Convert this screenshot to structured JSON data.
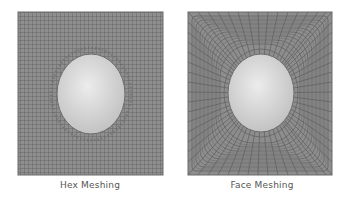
{
  "figure": {
    "panels": [
      {
        "id": "hex",
        "caption": "Hex Meshing",
        "mesh_type": "structured-grid",
        "bounds": {
          "x": 18,
          "y": 12,
          "w": 145,
          "h": 163
        },
        "hole": {
          "cx": 91,
          "cy": 94,
          "rx": 34,
          "ry": 40
        }
      },
      {
        "id": "face",
        "caption": "Face Meshing",
        "mesh_type": "radial-mapped",
        "bounds": {
          "x": 188,
          "y": 12,
          "w": 144,
          "h": 163
        },
        "hole": {
          "cx": 261,
          "cy": 93,
          "rx": 33,
          "ry": 39
        }
      }
    ],
    "colors": {
      "mesh_fill": "#8c8c8c",
      "mesh_line": "#5e5e5e",
      "hole_light": "#e8e8e8",
      "hole_dark": "#bdbdbd",
      "caption": "#555555"
    }
  }
}
